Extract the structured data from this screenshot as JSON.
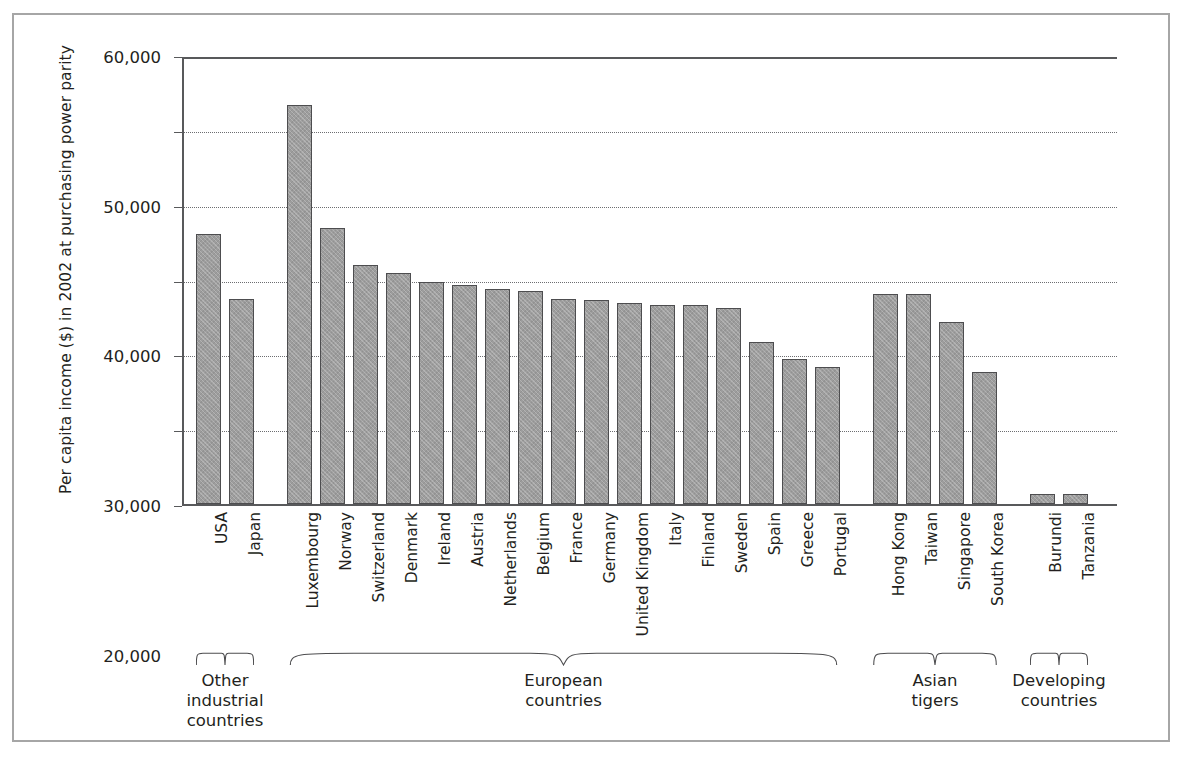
{
  "chart_data": {
    "type": "bar",
    "title": "",
    "subtitle": "",
    "xlabel": "",
    "ylabel": "Per capita income ($) in 2002 at purchasing power parity",
    "ylim": [
      0,
      60000
    ],
    "ytick_labels": [
      "0",
      "10,000",
      "20,000",
      "30,000",
      "40,000",
      "50,000",
      "60,000"
    ],
    "ytick_values": [
      0,
      10000,
      20000,
      30000,
      40000,
      50000,
      60000
    ],
    "grid": "horizontal-dotted",
    "legend": "none",
    "bar_color": "#9d9d9d",
    "bar_edge_color": "#4d4d4f",
    "categories": [
      "USA",
      "Japan",
      "Luxembourg",
      "Norway",
      "Switzerland",
      "Denmark",
      "Ireland",
      "Austria",
      "Netherlands",
      "Belgium",
      "France",
      "Germany",
      "United Kingdom",
      "Italy",
      "Finland",
      "Sweden",
      "Spain",
      "Greece",
      "Portugal",
      "Hong Kong",
      "Taiwan",
      "Singapore",
      "South Korea",
      "Burundi",
      "Tanzania"
    ],
    "values": [
      36200,
      27500,
      53400,
      37000,
      32000,
      30900,
      29700,
      29300,
      28800,
      28500,
      27400,
      27300,
      26900,
      26700,
      26600,
      26200,
      21700,
      19400,
      18300,
      28100,
      28100,
      24400,
      17700,
      1400,
      1400
    ],
    "groups": [
      {
        "label": "Other\nindustrial\ncountries",
        "first": 0,
        "last": 1
      },
      {
        "label": "European\ncountries",
        "first": 2,
        "last": 18
      },
      {
        "label": "Asian\ntigers",
        "first": 19,
        "last": 22
      },
      {
        "label": "Developing\ncountries",
        "first": 23,
        "last": 24
      }
    ]
  }
}
